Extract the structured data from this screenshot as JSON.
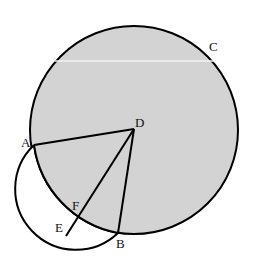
{
  "diagram": {
    "type": "geometry",
    "colors": {
      "fill": "#d3d3d3",
      "stroke": "#000000",
      "background": "#ffffff"
    },
    "big_circle": {
      "cx": 134,
      "cy": 130,
      "r": 104
    },
    "points": {
      "A": {
        "x": 34,
        "y": 145,
        "label": "A"
      },
      "B": {
        "x": 118,
        "y": 233,
        "label": "B"
      },
      "C": {
        "x": 214,
        "y": 58,
        "label": "C"
      },
      "D": {
        "x": 134,
        "y": 129,
        "label": "D"
      },
      "E": {
        "x": 66,
        "y": 236,
        "label": "E"
      },
      "F": {
        "x": 78,
        "y": 215,
        "label": "F"
      }
    },
    "labels": {
      "A": "A",
      "B": "B",
      "C": "C",
      "D": "D",
      "E": "E",
      "F": "F"
    }
  }
}
